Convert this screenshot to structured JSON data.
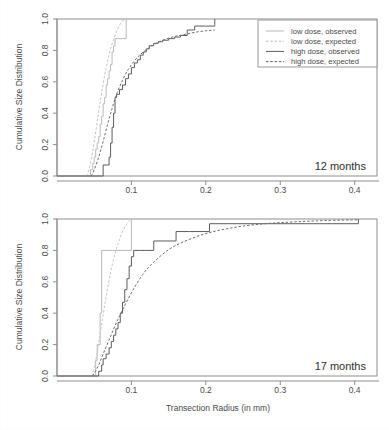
{
  "figure": {
    "axis_titles": {
      "x": "Transection Radius (in mm)",
      "y": "Cumulative Size Distribution"
    },
    "x_ticks": [
      "0.1",
      "0.2",
      "0.3",
      "0.4"
    ],
    "y_ticks": [
      "0.0",
      "0.2",
      "0.4",
      "0.6",
      "0.8",
      "1.0"
    ],
    "legend": {
      "items": [
        {
          "label": "low dose, observed",
          "style": "solid",
          "color": "#b9b9b9"
        },
        {
          "label": "low dose, expected",
          "style": "dashed",
          "color": "#b9b9b9"
        },
        {
          "label": "high dose, observed",
          "style": "solid",
          "color": "#5d5d5d"
        },
        {
          "label": "high dose, expected",
          "style": "dashed",
          "color": "#5d5d5d"
        }
      ]
    },
    "panels": [
      {
        "tag": "12 months"
      },
      {
        "tag": "17 months"
      }
    ]
  },
  "chart_data": [
    {
      "type": "line",
      "title": "12 months",
      "xlabel": "Transection Radius (in mm)",
      "ylabel": "Cumulative Size Distribution",
      "xlim": [
        0.0,
        0.43
      ],
      "ylim": [
        0.0,
        1.0
      ],
      "grid": false,
      "legend_position": "top-right",
      "series": [
        {
          "name": "low dose, observed",
          "style": "step",
          "color": "#b9b9b9",
          "x": [
            0.0,
            0.043,
            0.045,
            0.048,
            0.05,
            0.052,
            0.054,
            0.056,
            0.058,
            0.06,
            0.062,
            0.064,
            0.066,
            0.068,
            0.07,
            0.072,
            0.074,
            0.076,
            0.078,
            0.082,
            0.086,
            0.09,
            0.093,
            0.093
          ],
          "y": [
            0.0,
            0.0,
            0.04,
            0.08,
            0.12,
            0.17,
            0.21,
            0.25,
            0.33,
            0.38,
            0.46,
            0.5,
            0.58,
            0.62,
            0.67,
            0.71,
            0.79,
            0.83,
            0.875,
            0.875,
            0.875,
            0.875,
            0.875,
            1.0
          ]
        },
        {
          "name": "low dose, expected",
          "style": "smooth",
          "color": "#c4c4c4",
          "x": [
            0.04,
            0.044,
            0.048,
            0.052,
            0.056,
            0.06,
            0.064,
            0.068,
            0.072,
            0.076,
            0.08,
            0.084,
            0.088,
            0.092
          ],
          "y": [
            0.0,
            0.06,
            0.16,
            0.28,
            0.41,
            0.53,
            0.64,
            0.73,
            0.81,
            0.87,
            0.92,
            0.96,
            0.985,
            1.0
          ]
        },
        {
          "name": "high dose, observed",
          "style": "step",
          "color": "#5d5d5d",
          "x": [
            0.0,
            0.047,
            0.06,
            0.062,
            0.068,
            0.07,
            0.072,
            0.074,
            0.076,
            0.078,
            0.08,
            0.084,
            0.088,
            0.092,
            0.096,
            0.1,
            0.104,
            0.108,
            0.112,
            0.116,
            0.12,
            0.124,
            0.13,
            0.136,
            0.142,
            0.15,
            0.158,
            0.166,
            0.175,
            0.185,
            0.2,
            0.212,
            0.212
          ],
          "y": [
            0.0,
            0.0,
            0.0,
            0.07,
            0.07,
            0.12,
            0.21,
            0.31,
            0.4,
            0.5,
            0.52,
            0.55,
            0.58,
            0.62,
            0.65,
            0.69,
            0.72,
            0.74,
            0.77,
            0.79,
            0.81,
            0.83,
            0.845,
            0.855,
            0.865,
            0.875,
            0.885,
            0.895,
            0.93,
            0.955,
            0.955,
            0.965,
            1.0
          ]
        },
        {
          "name": "high dose, expected",
          "style": "smooth",
          "color": "#6e6e6e",
          "x": [
            0.046,
            0.05,
            0.056,
            0.062,
            0.068,
            0.074,
            0.08,
            0.088,
            0.096,
            0.106,
            0.116,
            0.128,
            0.14,
            0.155,
            0.17,
            0.185,
            0.2,
            0.212
          ],
          "y": [
            0.0,
            0.04,
            0.12,
            0.22,
            0.33,
            0.43,
            0.52,
            0.61,
            0.68,
            0.745,
            0.79,
            0.83,
            0.86,
            0.885,
            0.9,
            0.915,
            0.925,
            0.93
          ]
        }
      ]
    },
    {
      "type": "line",
      "title": "17 months",
      "xlabel": "Transection Radius (in mm)",
      "ylabel": "Cumulative Size Distribution",
      "xlim": [
        0.0,
        0.43
      ],
      "ylim": [
        0.0,
        1.0
      ],
      "grid": false,
      "legend_position": "none",
      "series": [
        {
          "name": "low dose, observed",
          "style": "step",
          "color": "#b9b9b9",
          "x": [
            0.0,
            0.05,
            0.052,
            0.054,
            0.056,
            0.058,
            0.06,
            0.06,
            0.075,
            0.1,
            0.1
          ],
          "y": [
            0.0,
            0.0,
            0.1,
            0.2,
            0.2,
            0.4,
            0.6,
            0.8,
            0.8,
            0.8,
            1.0
          ]
        },
        {
          "name": "low dose, expected",
          "style": "smooth",
          "color": "#c4c4c4",
          "x": [
            0.047,
            0.052,
            0.057,
            0.062,
            0.067,
            0.072,
            0.078,
            0.084,
            0.09,
            0.096,
            0.1
          ],
          "y": [
            0.0,
            0.1,
            0.24,
            0.39,
            0.53,
            0.66,
            0.78,
            0.87,
            0.94,
            0.98,
            1.0
          ]
        },
        {
          "name": "high dose, observed",
          "style": "step",
          "color": "#5d5d5d",
          "x": [
            0.0,
            0.05,
            0.056,
            0.06,
            0.062,
            0.066,
            0.07,
            0.073,
            0.076,
            0.079,
            0.082,
            0.085,
            0.088,
            0.091,
            0.094,
            0.097,
            0.1,
            0.103,
            0.106,
            0.112,
            0.118,
            0.13,
            0.145,
            0.16,
            0.178,
            0.205,
            0.205,
            0.405,
            0.405
          ],
          "y": [
            0.0,
            0.0,
            0.03,
            0.07,
            0.11,
            0.14,
            0.18,
            0.22,
            0.26,
            0.3,
            0.34,
            0.4,
            0.47,
            0.55,
            0.62,
            0.7,
            0.76,
            0.8,
            0.8,
            0.8,
            0.8,
            0.86,
            0.86,
            0.92,
            0.92,
            0.92,
            0.97,
            0.97,
            1.0
          ]
        },
        {
          "name": "high dose, expected",
          "style": "smooth",
          "color": "#6e6e6e",
          "x": [
            0.048,
            0.055,
            0.062,
            0.07,
            0.078,
            0.088,
            0.1,
            0.115,
            0.13,
            0.15,
            0.17,
            0.195,
            0.22,
            0.25,
            0.285,
            0.32,
            0.36,
            0.405
          ],
          "y": [
            0.0,
            0.06,
            0.14,
            0.23,
            0.32,
            0.42,
            0.53,
            0.645,
            0.725,
            0.805,
            0.855,
            0.9,
            0.93,
            0.955,
            0.972,
            0.982,
            0.99,
            0.995
          ]
        }
      ]
    }
  ]
}
